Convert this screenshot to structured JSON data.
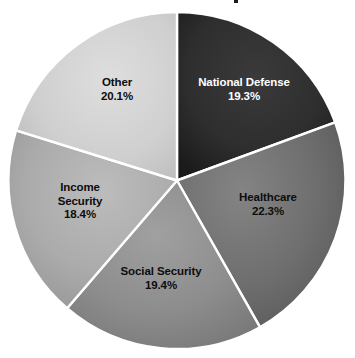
{
  "title": "",
  "chart_data": {
    "type": "pie",
    "title": "",
    "subtitle": "",
    "xlabel": "",
    "ylabel": "",
    "legend_position": "none",
    "grid": false,
    "units": "percent",
    "start_angle_deg": 0,
    "direction": "clockwise",
    "labels_inside_slices": true,
    "categories": [
      "National Defense",
      "Healthcare",
      "Social Security",
      "Income Security",
      "Other"
    ],
    "values": [
      19.3,
      22.3,
      19.4,
      18.4,
      20.1
    ],
    "slices": [
      {
        "label": "National Defense",
        "value": 19.3,
        "value_text": "19.3%",
        "color": "#2e2e2e",
        "color_edge": "#1d1d1d",
        "text_color": "#ffffff"
      },
      {
        "label": "Healthcare",
        "value": 22.3,
        "value_text": "22.3%",
        "color": "#6e6e6e",
        "color_edge": "#5a5a5a",
        "text_color": "#0d0d0d"
      },
      {
        "label": "Social Security",
        "value": 19.4,
        "value_text": "19.4%",
        "color": "#8d8d8d",
        "color_edge": "#7a7a7a",
        "text_color": "#0d0d0d"
      },
      {
        "label": "Income Security",
        "value": 18.4,
        "value_text": "18.4%",
        "color": "#ababab",
        "color_edge": "#999999",
        "text_color": "#0d0d0d"
      },
      {
        "label": "Other",
        "value": 20.1,
        "value_text": "20.1%",
        "color": "#cfcfcf",
        "color_edge": "#bdbdbd",
        "text_color": "#0d0d0d"
      }
    ],
    "separator_color": "#ffffff",
    "background_color": "#ffffff"
  },
  "labels": {
    "national_defense": {
      "name": "National Defense",
      "value": "19.3%"
    },
    "healthcare": {
      "name": "Healthcare",
      "value": "22.3%"
    },
    "social_security": {
      "name": "Social Security",
      "value": "19.4%"
    },
    "income_security": {
      "name": "Income",
      "name2": "Security",
      "value": "18.4%"
    },
    "other": {
      "name": "Other",
      "value": "20.1%"
    }
  }
}
